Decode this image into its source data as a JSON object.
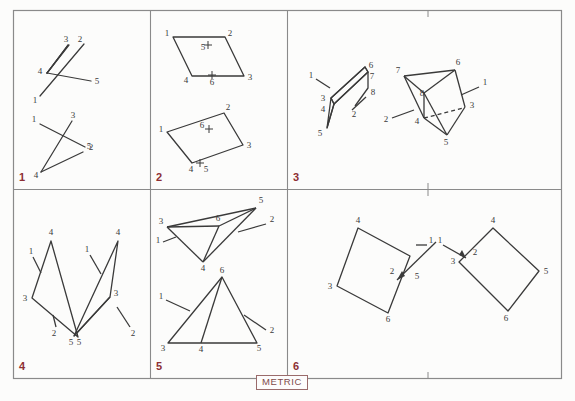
{
  "sheet": {
    "title": "Orthographic / pictorial exercise sheet",
    "metric_label": "METRIC",
    "background_color": "#fcfcfb",
    "border_color": "#8a8a8a",
    "line_color": "#3a3a3a",
    "number_color": "#8d2f33"
  },
  "panels": [
    {
      "id": "panel-1",
      "number": "1",
      "figures": [
        {
          "name": "open-polyline-upper",
          "labels": [
            "3",
            "2",
            "4",
            "5",
            "1"
          ]
        },
        {
          "name": "open-polyline-lower",
          "labels": [
            "1",
            "3",
            "2",
            "5",
            "4"
          ]
        }
      ]
    },
    {
      "id": "panel-2",
      "number": "2",
      "figures": [
        {
          "name": "parallelogram-upper",
          "labels": [
            "1",
            "2",
            "3",
            "4",
            "5",
            "6"
          ]
        },
        {
          "name": "parallelogram-lower",
          "labels": [
            "1",
            "2",
            "3",
            "4",
            "5",
            "6"
          ]
        }
      ]
    },
    {
      "id": "panel-3",
      "number": "3",
      "figures": [
        {
          "name": "oblique-plane",
          "labels": [
            "1",
            "2",
            "3",
            "4",
            "5",
            "6",
            "7",
            "8"
          ]
        },
        {
          "name": "wedge-solid",
          "labels": [
            "1",
            "2",
            "3",
            "4",
            "5",
            "6",
            "7",
            "8"
          ]
        }
      ]
    },
    {
      "id": "panel-4",
      "number": "4",
      "figures": [
        {
          "name": "triangle-left",
          "labels": [
            "1",
            "2",
            "3",
            "4",
            "5"
          ]
        },
        {
          "name": "triangle-right",
          "labels": [
            "1",
            "2",
            "3",
            "4",
            "5"
          ]
        }
      ]
    },
    {
      "id": "panel-5",
      "number": "5",
      "figures": [
        {
          "name": "folded-triangle-upper",
          "labels": [
            "1",
            "2",
            "3",
            "4",
            "5",
            "6"
          ]
        },
        {
          "name": "triangle-with-median-lower",
          "labels": [
            "1",
            "2",
            "3",
            "4",
            "5",
            "6"
          ]
        }
      ]
    },
    {
      "id": "panel-6",
      "number": "6",
      "figures": [
        {
          "name": "diamond-left",
          "labels": [
            "1",
            "2",
            "3",
            "4",
            "5",
            "6"
          ]
        },
        {
          "name": "diamond-right",
          "labels": [
            "1",
            "2",
            "3",
            "4",
            "5",
            "6"
          ]
        }
      ]
    }
  ],
  "labels": {
    "p1a": {
      "n3": "3",
      "n2": "2",
      "n4": "4",
      "n5": "5",
      "n1": "1"
    },
    "p1b": {
      "n1": "1",
      "n3": "3",
      "n2": "2",
      "n5": "5",
      "n4": "4"
    },
    "p2a": {
      "n1": "1",
      "n2": "2",
      "n3": "3",
      "n4": "4",
      "n5": "5",
      "n6": "6"
    },
    "p2b": {
      "n1": "1",
      "n2": "2",
      "n3": "3",
      "n4": "4",
      "n5": "5",
      "n6": "6"
    },
    "p3a": {
      "n1": "1",
      "n2": "2",
      "n3": "3",
      "n4": "4",
      "n5": "5",
      "n6": "6",
      "n7": "7",
      "n8": "8"
    },
    "p3b": {
      "n1": "1",
      "n2": "2",
      "n3": "3",
      "n4": "4",
      "n5": "5",
      "n6": "6",
      "n7": "7",
      "n8": "8"
    },
    "p4a": {
      "n1": "1",
      "n2": "2",
      "n3": "3",
      "n4": "4",
      "n5": "5"
    },
    "p4b": {
      "n1": "1",
      "n2": "2",
      "n3": "3",
      "n4": "4",
      "n5": "5"
    },
    "p5a": {
      "n1": "1",
      "n2": "2",
      "n3": "3",
      "n4": "4",
      "n5": "5",
      "n6": "6"
    },
    "p5b": {
      "n1": "1",
      "n2": "2",
      "n3": "3",
      "n4": "4",
      "n5": "5",
      "n6": "6"
    },
    "p6a": {
      "n1": "1",
      "n2": "2",
      "n3": "3",
      "n4": "4",
      "n5": "5",
      "n6": "6"
    },
    "p6b": {
      "n1": "1",
      "n2": "2",
      "n3": "3",
      "n4": "4",
      "n5": "5",
      "n6": "6"
    }
  },
  "panel_numbers": {
    "one": "1",
    "two": "2",
    "three": "3",
    "four": "4",
    "five": "5",
    "six": "6"
  }
}
